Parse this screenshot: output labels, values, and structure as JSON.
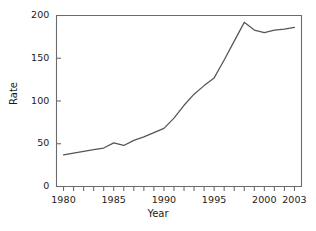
{
  "chart_data": {
    "type": "line",
    "title": "",
    "xlabel": "Year",
    "ylabel": "Rate",
    "xlim": [
      1979.3,
      2003.7
    ],
    "ylim": [
      0,
      200
    ],
    "grid": false,
    "legend": null,
    "line_color": "#555555",
    "axis_color": "#6b6b6b",
    "x_tick_labels": [
      "1980",
      "1985",
      "1990",
      "1995",
      "2000",
      "2003"
    ],
    "x_tick_label_values": [
      1980,
      1985,
      1990,
      1995,
      2000,
      2003
    ],
    "x_minor_ticks": [
      1980,
      1981,
      1982,
      1983,
      1984,
      1985,
      1986,
      1987,
      1988,
      1989,
      1990,
      1991,
      1992,
      1993,
      1994,
      1995,
      1996,
      1997,
      1998,
      1999,
      2000,
      2001,
      2002,
      2003
    ],
    "y_tick_labels": [
      "0",
      "50",
      "100",
      "150",
      "200"
    ],
    "y_tick_values": [
      0,
      50,
      100,
      150,
      200
    ],
    "x": [
      1980,
      1981,
      1982,
      1983,
      1984,
      1985,
      1986,
      1987,
      1988,
      1989,
      1990,
      1991,
      1992,
      1993,
      1994,
      1995,
      1996,
      1997,
      1998,
      1999,
      2000,
      2001,
      2002,
      2003
    ],
    "values": [
      37,
      39,
      41,
      43,
      45,
      51,
      48,
      54,
      58,
      63,
      68,
      80,
      95,
      108,
      118,
      127,
      148,
      170,
      192,
      183,
      180,
      183,
      184,
      186
    ],
    "series": [
      {
        "name": "Rate",
        "values": [
          37,
          39,
          41,
          43,
          45,
          51,
          48,
          54,
          58,
          63,
          68,
          80,
          95,
          108,
          118,
          127,
          148,
          170,
          192,
          183,
          180,
          183,
          184,
          186
        ]
      }
    ]
  }
}
